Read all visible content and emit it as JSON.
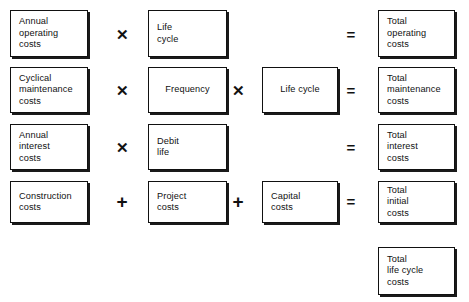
{
  "diagram": {
    "colors": {
      "box_border": "#111111",
      "box_fill": "#ffffff",
      "text": "#111111",
      "background": "#ffffff"
    },
    "operators": {
      "times": "✕",
      "plus": "+",
      "equals": "="
    },
    "rows": [
      {
        "id": "operating",
        "input": "Annual\noperating\ncosts",
        "operator_1": "✕",
        "factor_1": "Life\ncycle",
        "operator_2": "",
        "factor_2": "",
        "operator_result": "=",
        "result": "Total\noperating\ncosts"
      },
      {
        "id": "maintenance",
        "input": "Cyclical\nmaintenance\ncosts",
        "operator_1": "✕",
        "factor_1": "Frequency",
        "operator_2": "✕",
        "factor_2": "Life cycle",
        "operator_result": "=",
        "result": "Total\nmaintenance\ncosts"
      },
      {
        "id": "interest",
        "input": "Annual\ninterest\ncosts",
        "operator_1": "✕",
        "factor_1": "Debit\nlife",
        "operator_2": "",
        "factor_2": "",
        "operator_result": "=",
        "result": "Total\ninterest\ncosts"
      },
      {
        "id": "initial",
        "input": "Construction\ncosts",
        "operator_1": "+",
        "factor_1": "Project\ncosts",
        "operator_2": "+",
        "factor_2": "Capital\ncosts",
        "operator_result": "=",
        "result": "Total\ninitial\ncosts"
      }
    ],
    "total": {
      "label": "Total\nlife cycle\ncosts"
    }
  }
}
